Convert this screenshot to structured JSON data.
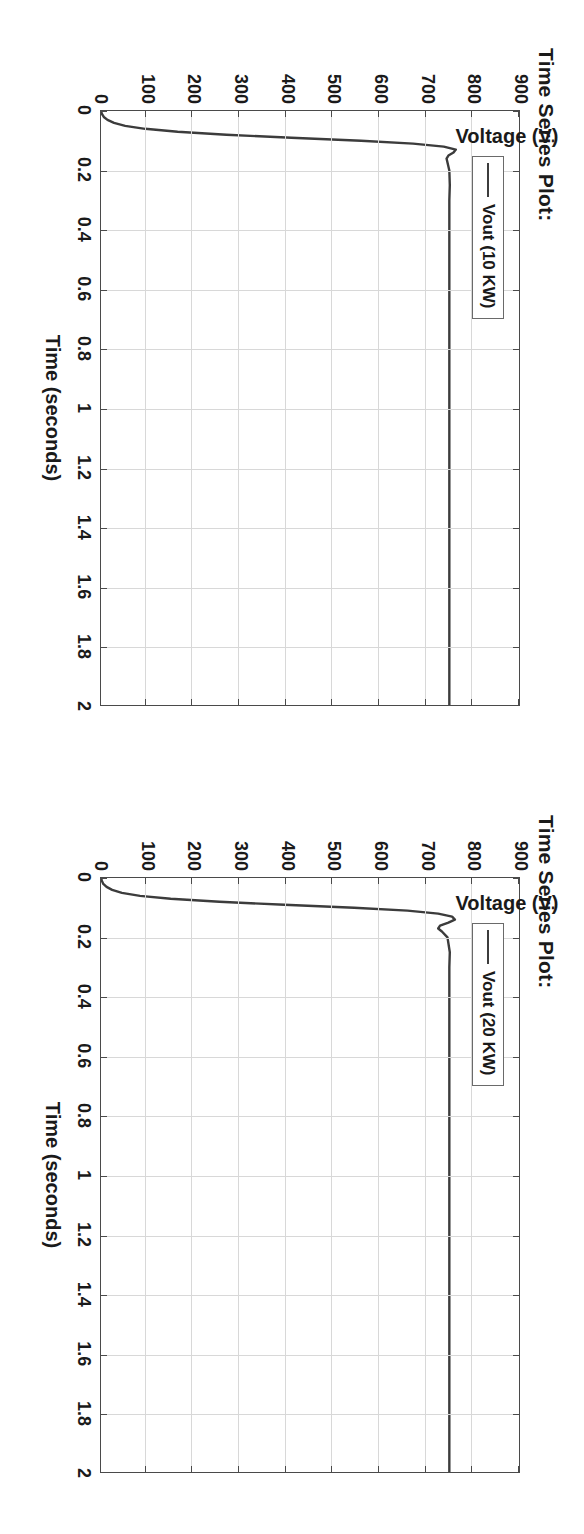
{
  "page": {
    "background": "#ffffff",
    "orientation_note": "content rotated 90 degrees clockwise",
    "figure_count": 2
  },
  "figures": [
    {
      "id": "figure-top",
      "title": "Time Series Plot:",
      "legend_label": "Vout (10 KW)",
      "axis_title_x": "Time (seconds)",
      "axis_title_y": "Voltage (V)"
    },
    {
      "id": "figure-bottom",
      "title": "Time Series Plot:",
      "legend_label": "Vout (20 KW)",
      "axis_title_x": "Time (seconds)",
      "axis_title_y": "Voltage (V)"
    }
  ],
  "style": {
    "line_color": "#3c3c3c",
    "grid_color": "#d8d8d8",
    "frame_color": "#4a4a4a",
    "text_color": "#1a1a1a"
  },
  "chart_data": [
    {
      "type": "line",
      "title": "Time Series Plot:",
      "xlabel": "Time (seconds)",
      "ylabel": "Voltage (V)",
      "xlim": [
        0,
        2
      ],
      "ylim": [
        0,
        900
      ],
      "xticks": [
        0,
        0.2,
        0.4,
        0.6,
        0.8,
        1,
        1.2,
        1.4,
        1.6,
        1.8,
        2
      ],
      "xticklabels": [
        "0",
        "0.2",
        "0.4",
        "0.6",
        "0.8",
        "1",
        "1.2",
        "1.4",
        "1.6",
        "1.8",
        "2"
      ],
      "yticks": [
        0,
        100,
        200,
        300,
        400,
        500,
        600,
        700,
        800,
        900
      ],
      "yticklabels": [
        "0",
        "100",
        "200",
        "300",
        "400",
        "500",
        "600",
        "700",
        "800",
        "900"
      ],
      "grid": true,
      "legend": [
        "Vout (10 KW)"
      ],
      "legend_position": "top-left",
      "series": [
        {
          "name": "Vout (10 KW)",
          "x": [
            0.0,
            0.01,
            0.02,
            0.03,
            0.04,
            0.05,
            0.06,
            0.07,
            0.08,
            0.09,
            0.1,
            0.11,
            0.12,
            0.13,
            0.14,
            0.15,
            0.16,
            0.18,
            0.2,
            0.25,
            0.3,
            0.4,
            0.5,
            0.6,
            0.7,
            0.8,
            0.9,
            1.0,
            1.1,
            1.2,
            1.3,
            1.4,
            1.5,
            1.6,
            1.7,
            1.8,
            1.9,
            2.0
          ],
          "y": [
            0,
            2,
            6,
            14,
            28,
            52,
            95,
            165,
            270,
            410,
            560,
            672,
            738,
            764,
            759,
            748,
            744,
            747,
            750,
            751,
            750,
            750,
            750,
            750,
            750,
            750,
            750,
            750,
            750,
            750,
            750,
            750,
            750,
            750,
            750,
            750,
            750,
            750
          ]
        }
      ],
      "steady_state_value": 750
    },
    {
      "type": "line",
      "title": "Time Series Plot:",
      "xlabel": "Time (seconds)",
      "ylabel": "Voltage (V)",
      "xlim": [
        0,
        2
      ],
      "ylim": [
        0,
        900
      ],
      "xticks": [
        0,
        0.2,
        0.4,
        0.6,
        0.8,
        1,
        1.2,
        1.4,
        1.6,
        1.8,
        2
      ],
      "xticklabels": [
        "0",
        "0.2",
        "0.4",
        "0.6",
        "0.8",
        "1",
        "1.2",
        "1.4",
        "1.6",
        "1.8",
        "2"
      ],
      "yticks": [
        0,
        100,
        200,
        300,
        400,
        500,
        600,
        700,
        800,
        900
      ],
      "yticklabels": [
        "0",
        "100",
        "200",
        "300",
        "400",
        "500",
        "600",
        "700",
        "800",
        "900"
      ],
      "grid": true,
      "legend": [
        "Vout (20 KW)"
      ],
      "legend_position": "top-left",
      "series": [
        {
          "name": "Vout (20 KW)",
          "x": [
            0.0,
            0.01,
            0.02,
            0.03,
            0.04,
            0.05,
            0.06,
            0.07,
            0.08,
            0.09,
            0.1,
            0.11,
            0.12,
            0.13,
            0.14,
            0.15,
            0.16,
            0.17,
            0.18,
            0.2,
            0.25,
            0.3,
            0.4,
            0.5,
            0.6,
            0.7,
            0.8,
            0.9,
            1.0,
            1.1,
            1.2,
            1.3,
            1.4,
            1.5,
            1.6,
            1.7,
            1.8,
            1.9,
            2.0
          ],
          "y": [
            0,
            2,
            5,
            12,
            24,
            45,
            84,
            150,
            255,
            395,
            545,
            660,
            726,
            756,
            762,
            748,
            730,
            726,
            734,
            746,
            751,
            750,
            750,
            750,
            750,
            750,
            750,
            750,
            750,
            750,
            750,
            750,
            750,
            750,
            750,
            750,
            750,
            750,
            750
          ]
        }
      ],
      "steady_state_value": 750
    }
  ]
}
